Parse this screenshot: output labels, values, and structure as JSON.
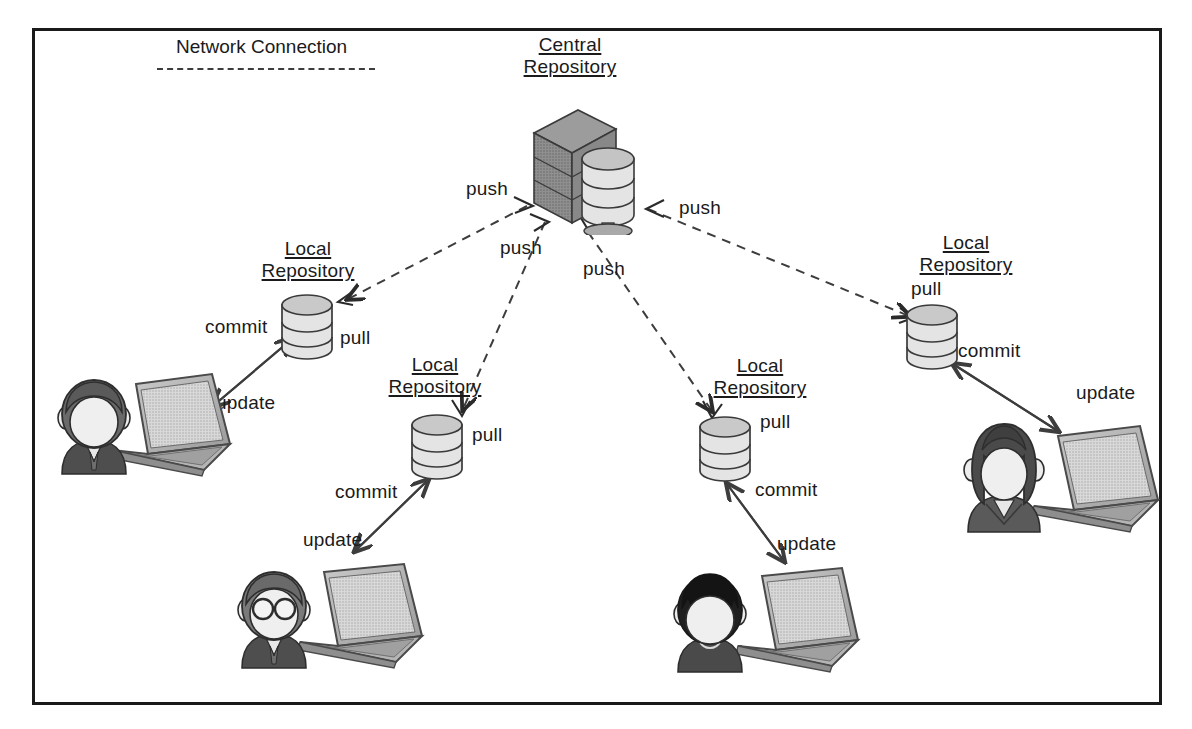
{
  "diagram": {
    "background": "#ffffff",
    "frame_color": "#1a1a1a",
    "dashed_color": "#3d3d3d",
    "solid_arrow_color": "#3d3d3d"
  },
  "legend": {
    "label": "Network Connection",
    "line_style": "dashed"
  },
  "central": {
    "title_line1": "Central",
    "title_line2": "Repository",
    "icon": "server-database-icon"
  },
  "push_labels": [
    {
      "text": "push",
      "x": 466,
      "y": 178
    },
    {
      "text": "push",
      "x": 500,
      "y": 237
    },
    {
      "text": "push",
      "x": 583,
      "y": 258
    },
    {
      "text": "push",
      "x": 679,
      "y": 197
    }
  ],
  "nodes": [
    {
      "id": "node-left",
      "title_line1": "Local",
      "title_line2": "Repository",
      "repo_icon": "database-cylinder-icon",
      "person_icon": "person-avatar-icon",
      "person_style": "short-hair-tie",
      "laptop_icon": "laptop-icon",
      "pull_label": "pull",
      "commit_label": "commit",
      "update_label": "update"
    },
    {
      "id": "node-lower-left",
      "title_line1": "Local",
      "title_line2": "Repository",
      "repo_icon": "database-cylinder-icon",
      "person_icon": "person-avatar-icon",
      "person_style": "glasses-tie",
      "laptop_icon": "laptop-icon",
      "pull_label": "pull",
      "commit_label": "commit",
      "update_label": "update"
    },
    {
      "id": "node-lower-right",
      "title_line1": "Local",
      "title_line2": "Repository",
      "repo_icon": "database-cylinder-icon",
      "person_icon": "person-avatar-icon",
      "person_style": "dark-spiky-hair",
      "laptop_icon": "laptop-icon",
      "pull_label": "pull",
      "commit_label": "commit",
      "update_label": "update"
    },
    {
      "id": "node-right",
      "title_line1": "Local",
      "title_line2": "Repository",
      "repo_icon": "database-cylinder-icon",
      "person_icon": "person-avatar-icon",
      "person_style": "long-hair-suit",
      "laptop_icon": "laptop-icon",
      "pull_label": "pull",
      "commit_label": "commit",
      "update_label": "update"
    }
  ]
}
